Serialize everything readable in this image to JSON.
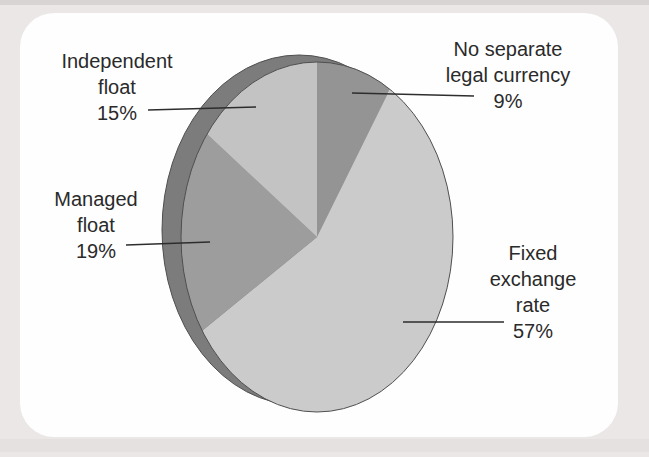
{
  "figure": {
    "background_color": "#eae7e6",
    "panel_color": "#fefefe",
    "top_strip_color": "#d8d4d3",
    "bottom_band_color": "#e0dcdb",
    "text_color": "#2a2a2a"
  },
  "chart_data": {
    "type": "pie",
    "style": "3d-tilted-disc",
    "title": "",
    "categories": [
      "No separate legal currency",
      "Fixed exchange rate",
      "Managed float",
      "Independent float"
    ],
    "values": [
      9,
      57,
      19,
      15
    ],
    "unit": "%",
    "direction": "clockwise",
    "start_angle_deg": 0,
    "slice_ids": [
      "no-separate-legal-currency",
      "fixed-exchange-rate",
      "managed-float",
      "independent-float"
    ],
    "slice_colors": [
      "#949494",
      "#cbcbcb",
      "#9d9d9d",
      "#c3c3c3"
    ],
    "rim_color": "#7c7c7c",
    "outline_color": "#4f4f4f",
    "leader_line_color": "#2d2d2d",
    "legend_position": "callout-labels",
    "geometry": {
      "cx": 317,
      "cy": 237,
      "rx": 136,
      "ry": 175,
      "rim_cx": 299,
      "rim_cy": 230,
      "rim_rx": 137,
      "rim_ry": 175
    },
    "callouts": [
      {
        "id": "no-separate-legal-currency",
        "lines": [
          "No separate",
          "legal currency",
          "9%"
        ],
        "text_cx": 508,
        "text_top": 36,
        "leader": {
          "x1": 352,
          "y1": 93,
          "x2": 474,
          "y2": 96
        }
      },
      {
        "id": "fixed-exchange-rate",
        "lines": [
          "Fixed",
          "exchange",
          "rate",
          "57%"
        ],
        "text_cx": 533,
        "text_top": 240,
        "leader": {
          "x1": 403,
          "y1": 322,
          "x2": 504,
          "y2": 322
        }
      },
      {
        "id": "managed-float",
        "lines": [
          "Managed",
          "float",
          "19%"
        ],
        "text_cx": 96,
        "text_top": 186,
        "leader": {
          "x1": 126,
          "y1": 245,
          "x2": 210,
          "y2": 242
        }
      },
      {
        "id": "independent-float",
        "lines": [
          "Independent",
          "float",
          "15%"
        ],
        "text_cx": 117,
        "text_top": 48,
        "leader": {
          "x1": 148,
          "y1": 110,
          "x2": 256,
          "y2": 107
        }
      }
    ]
  }
}
